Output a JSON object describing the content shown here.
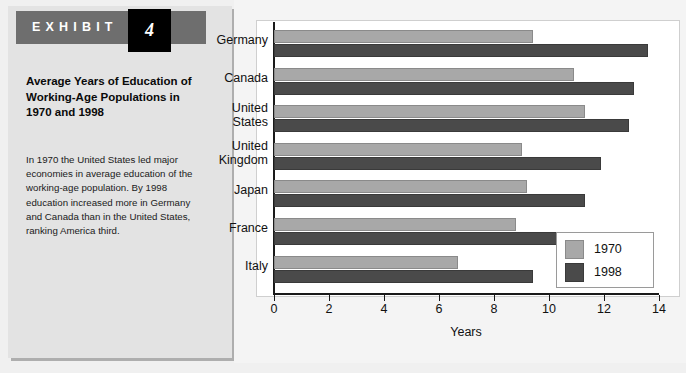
{
  "exhibit": {
    "label": "EXHIBIT",
    "number": "4",
    "title": "Average Years of Education of Working-Age Populations in 1970 and 1998",
    "body": "In 1970 the United States led major economies in average education of the working-age population. By 1998 education increased more in Germany and Canada than in the United States, ranking America third.",
    "header_bg": "#6e6e6e",
    "number_bg": "#000000",
    "panel_bg": "#e3e3e3"
  },
  "chart_data": {
    "type": "bar",
    "orientation": "horizontal",
    "title": "Average Years of Education of Working-Age Populations in 1970 and 1998",
    "categories": [
      "Germany",
      "Canada",
      "United States",
      "United Kingdom",
      "Japan",
      "France",
      "Italy"
    ],
    "series": [
      {
        "name": "1970",
        "color": "#a8a8a8",
        "values": [
          9.4,
          10.9,
          11.3,
          9.0,
          9.2,
          8.8,
          6.7
        ]
      },
      {
        "name": "1998",
        "color": "#4a4a4a",
        "values": [
          13.6,
          13.1,
          12.9,
          11.9,
          11.3,
          10.8,
          9.4
        ]
      }
    ],
    "xlabel": "Years",
    "ylabel": "",
    "xlim": [
      0,
      14
    ],
    "xticks": [
      "0",
      "2",
      "4",
      "6",
      "8",
      "10",
      "12",
      "14"
    ],
    "xtick_values": [
      0,
      2,
      4,
      6,
      8,
      10,
      12,
      14
    ],
    "grid": false,
    "legend_position": "bottom-right",
    "legend_entries": [
      "1970",
      "1998"
    ],
    "plot_bg": "#ffffff"
  }
}
